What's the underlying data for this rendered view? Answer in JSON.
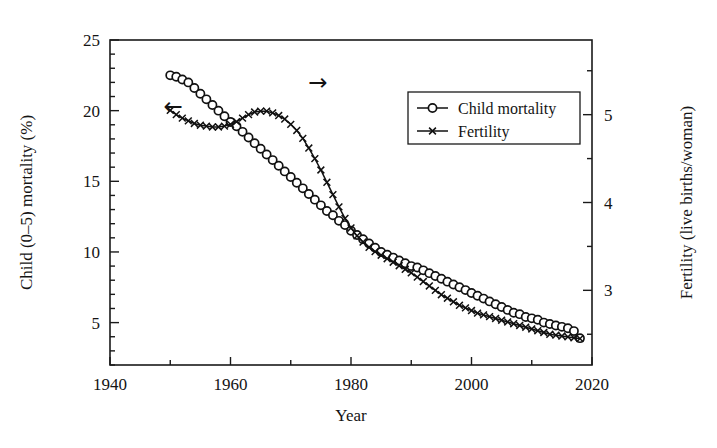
{
  "chart_data": {
    "type": "line",
    "title": "",
    "xlabel": "Year",
    "ylabel": "Child (0–5) mortality (%)",
    "y2label": "Fertility (live births/woman)",
    "xlim": [
      1940,
      2020
    ],
    "xticks": [
      1940,
      1960,
      1980,
      2000,
      2020
    ],
    "xtick_labels": [
      "1940",
      "1960",
      "1980",
      "2000",
      "2020"
    ],
    "xminor_step": 10,
    "ylim": [
      2.0,
      25.0
    ],
    "yticks": [
      5,
      10,
      15,
      20,
      25
    ],
    "ytick_labels": [
      "5",
      "10",
      "15",
      "20",
      "25"
    ],
    "yminor_step": 1,
    "y2lim": [
      2.15,
      5.85
    ],
    "y2ticks": [
      3,
      4,
      5
    ],
    "y2tick_labels": [
      "3",
      "4",
      "5"
    ],
    "y2minor_step": 0.5,
    "grid": false,
    "legend_position": "upper right",
    "annotations": [
      {
        "name": "left-axis-arrow",
        "text": "←",
        "x": 1950.5,
        "y_left": 20.3
      },
      {
        "name": "right-axis-arrow",
        "text": "→",
        "x": 1974.5,
        "y_left": 22.0
      }
    ],
    "series": [
      {
        "name": "Child mortality",
        "axis": "left",
        "marker": "circle",
        "color": "#111111",
        "x": [
          1950,
          1951,
          1952,
          1953,
          1954,
          1955,
          1956,
          1957,
          1958,
          1959,
          1960,
          1961,
          1962,
          1963,
          1964,
          1965,
          1966,
          1967,
          1968,
          1969,
          1970,
          1971,
          1972,
          1973,
          1974,
          1975,
          1976,
          1977,
          1978,
          1979,
          1980,
          1981,
          1982,
          1983,
          1984,
          1985,
          1986,
          1987,
          1988,
          1989,
          1990,
          1991,
          1992,
          1993,
          1994,
          1995,
          1996,
          1997,
          1998,
          1999,
          2000,
          2001,
          2002,
          2003,
          2004,
          2005,
          2006,
          2007,
          2008,
          2009,
          2010,
          2011,
          2012,
          2013,
          2014,
          2015,
          2016,
          2017,
          2018
        ],
        "y": [
          22.5,
          22.4,
          22.2,
          22.0,
          21.6,
          21.2,
          20.8,
          20.4,
          20.0,
          19.6,
          19.2,
          18.9,
          18.5,
          18.1,
          17.7,
          17.3,
          16.9,
          16.5,
          16.1,
          15.7,
          15.3,
          14.9,
          14.5,
          14.1,
          13.7,
          13.3,
          12.9,
          12.6,
          12.2,
          11.9,
          11.5,
          11.2,
          10.9,
          10.6,
          10.3,
          10.0,
          9.8,
          9.6,
          9.4,
          9.2,
          9.0,
          8.9,
          8.7,
          8.5,
          8.3,
          8.1,
          7.9,
          7.7,
          7.5,
          7.3,
          7.1,
          6.9,
          6.7,
          6.5,
          6.3,
          6.1,
          5.9,
          5.7,
          5.6,
          5.4,
          5.3,
          5.2,
          5.0,
          4.9,
          4.8,
          4.7,
          4.6,
          4.4,
          3.9
        ]
      },
      {
        "name": "Fertility",
        "axis": "right",
        "marker": "x",
        "color": "#111111",
        "x": [
          1950,
          1951,
          1952,
          1953,
          1954,
          1955,
          1956,
          1957,
          1958,
          1959,
          1960,
          1961,
          1962,
          1963,
          1964,
          1965,
          1966,
          1967,
          1968,
          1969,
          1970,
          1971,
          1972,
          1973,
          1974,
          1975,
          1976,
          1977,
          1978,
          1979,
          1980,
          1981,
          1982,
          1983,
          1984,
          1985,
          1986,
          1987,
          1988,
          1989,
          1990,
          1991,
          1992,
          1993,
          1994,
          1995,
          1996,
          1997,
          1998,
          1999,
          2000,
          2001,
          2002,
          2003,
          2004,
          2005,
          2006,
          2007,
          2008,
          2009,
          2010,
          2011,
          2012,
          2013,
          2014,
          2015,
          2016,
          2017,
          2018
        ],
        "y": [
          5.05,
          5.0,
          4.96,
          4.93,
          4.9,
          4.88,
          4.87,
          4.86,
          4.86,
          4.87,
          4.89,
          4.92,
          4.96,
          5.0,
          5.03,
          5.04,
          5.04,
          5.02,
          4.99,
          4.95,
          4.89,
          4.82,
          4.73,
          4.62,
          4.5,
          4.37,
          4.23,
          4.09,
          3.95,
          3.82,
          3.71,
          3.62,
          3.55,
          3.49,
          3.44,
          3.4,
          3.36,
          3.32,
          3.28,
          3.24,
          3.2,
          3.15,
          3.1,
          3.05,
          3.0,
          2.95,
          2.91,
          2.87,
          2.83,
          2.8,
          2.77,
          2.74,
          2.72,
          2.7,
          2.68,
          2.66,
          2.64,
          2.62,
          2.6,
          2.58,
          2.56,
          2.54,
          2.52,
          2.5,
          2.49,
          2.48,
          2.47,
          2.46,
          2.45
        ]
      }
    ],
    "legend": [
      {
        "label": "Child mortality",
        "marker": "circle"
      },
      {
        "label": "Fertility",
        "marker": "x"
      }
    ]
  }
}
